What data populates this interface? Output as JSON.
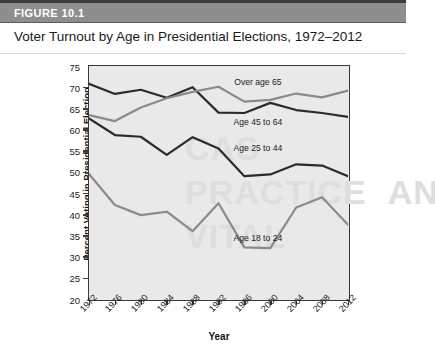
{
  "figure": {
    "header_label": "FIGURE 10.1",
    "title": "Voter Turnout by Age in Presidential Elections, 1972–2012"
  },
  "chart_data": {
    "type": "line",
    "title": "Voter Turnout by Age in Presidential Elections, 1972–2012",
    "xlabel": "Year",
    "ylabel": "Percent Voting in Presidential Election",
    "x": [
      1972,
      1976,
      1980,
      1984,
      1988,
      1992,
      1996,
      2000,
      2004,
      2008,
      2012
    ],
    "xtick_labels": [
      "1972",
      "1976",
      "1980",
      "1984",
      "1988",
      "1992",
      "1996",
      "2000",
      "2004",
      "2008",
      "2012"
    ],
    "ytick_labels": [
      "20",
      "25",
      "30",
      "35",
      "40",
      "45",
      "50",
      "55",
      "60",
      "65",
      "70",
      "75"
    ],
    "xlim": [
      1972,
      2012
    ],
    "ylim": [
      20,
      75
    ],
    "ytick_step": 5,
    "grid": false,
    "legend_position": "inline-labels",
    "series": [
      {
        "name": "Age 45 to 64",
        "color": "#2b2b2b",
        "label_x": 1998,
        "label_y": 61.8,
        "values": [
          70.8,
          68.4,
          69.4,
          67.5,
          70.0,
          64.0,
          63.9,
          66.3,
          64.6,
          63.9,
          63.0
        ]
      },
      {
        "name": "Over age 65",
        "color": "#8a8a8a",
        "label_x": 1998,
        "label_y": 71.4,
        "values": [
          63.4,
          62.0,
          65.2,
          67.4,
          68.9,
          70.1,
          66.6,
          67.0,
          68.5,
          67.6,
          69.2
        ]
      },
      {
        "name": "Age 25 to 44",
        "color": "#2b2b2b",
        "label_x": 1998,
        "label_y": 55.8,
        "values": [
          62.6,
          58.7,
          58.3,
          54.0,
          58.2,
          55.5,
          49.0,
          49.4,
          51.8,
          51.5,
          49.0
        ]
      },
      {
        "name": "Age 18 to 24",
        "color": "#8a8a8a",
        "label_x": 1998,
        "label_y": 34.4,
        "values": [
          49.5,
          42.2,
          39.8,
          40.6,
          36.0,
          42.6,
          32.2,
          32.0,
          41.6,
          44.0,
          37.5
        ]
      }
    ]
  }
}
